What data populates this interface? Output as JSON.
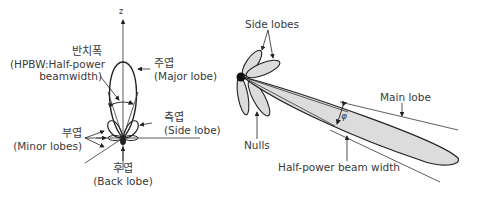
{
  "left_diagram": {
    "axis_label": "z",
    "hpbw": {
      "korean": "반치폭",
      "english_line1": "(HPBW:Half-power",
      "english_line2": "beamwidth)"
    },
    "major_lobe": {
      "korean": "주엽",
      "english": "(Major lobe)"
    },
    "side_lobe": {
      "korean": "측엽",
      "english": "(Side lobe)"
    },
    "minor_lobes": {
      "korean": "부엽",
      "english": "(Minor lobes)"
    },
    "back_lobe": {
      "korean": "후엽",
      "english": "(Back lobe)"
    }
  },
  "right_diagram": {
    "side_lobes": "Side lobes",
    "main_lobe": "Main lobe",
    "nulls": "Nulls",
    "hpbw": "Half-power beam width",
    "angle_symbol": "φ"
  },
  "colors": {
    "lobe_fill": "#dcdcdc",
    "stroke": "#222222",
    "text": "#3a3a3a"
  }
}
